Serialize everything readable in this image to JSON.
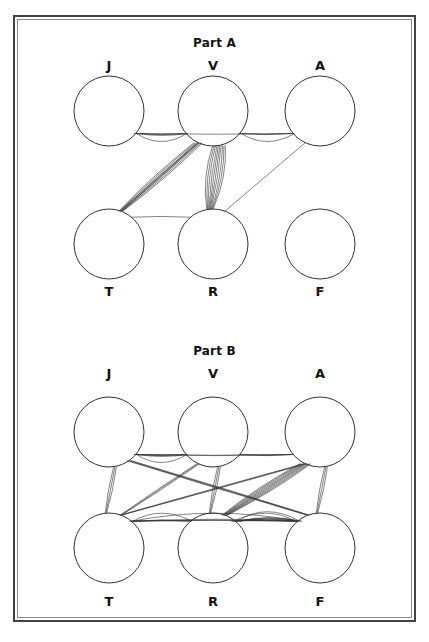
{
  "diagram": {
    "parts": [
      {
        "title": "Part A",
        "top_nodes": [
          "J",
          "V",
          "A"
        ],
        "bottom_nodes": [
          "T",
          "R",
          "F"
        ],
        "edges": [
          {
            "from": "J",
            "to": "V",
            "count": 4
          },
          {
            "from": "J",
            "to": "A",
            "count": 1
          },
          {
            "from": "V",
            "to": "A",
            "count": 3
          },
          {
            "from": "V",
            "to": "T",
            "count": 7
          },
          {
            "from": "V",
            "to": "R",
            "count": 10
          },
          {
            "from": "A",
            "to": "R",
            "count": 1
          },
          {
            "from": "T",
            "to": "R",
            "count": 1
          },
          {
            "from": "T",
            "to": "V",
            "count": 2
          }
        ]
      },
      {
        "title": "Part B",
        "top_nodes": [
          "J",
          "V",
          "A"
        ],
        "bottom_nodes": [
          "T",
          "R",
          "F"
        ],
        "edges": [
          {
            "from": "J",
            "to": "V",
            "count": 4
          },
          {
            "from": "J",
            "to": "A",
            "count": 2
          },
          {
            "from": "J",
            "to": "T",
            "count": 3
          },
          {
            "from": "J",
            "to": "F",
            "count": 4
          },
          {
            "from": "V",
            "to": "A",
            "count": 2
          },
          {
            "from": "V",
            "to": "T",
            "count": 3
          },
          {
            "from": "V",
            "to": "R",
            "count": 3
          },
          {
            "from": "A",
            "to": "T",
            "count": 3
          },
          {
            "from": "A",
            "to": "R",
            "count": 9
          },
          {
            "from": "A",
            "to": "F",
            "count": 3
          },
          {
            "from": "T",
            "to": "R",
            "count": 3
          },
          {
            "from": "T",
            "to": "F",
            "count": 4
          },
          {
            "from": "R",
            "to": "F",
            "count": 8
          }
        ]
      }
    ]
  }
}
